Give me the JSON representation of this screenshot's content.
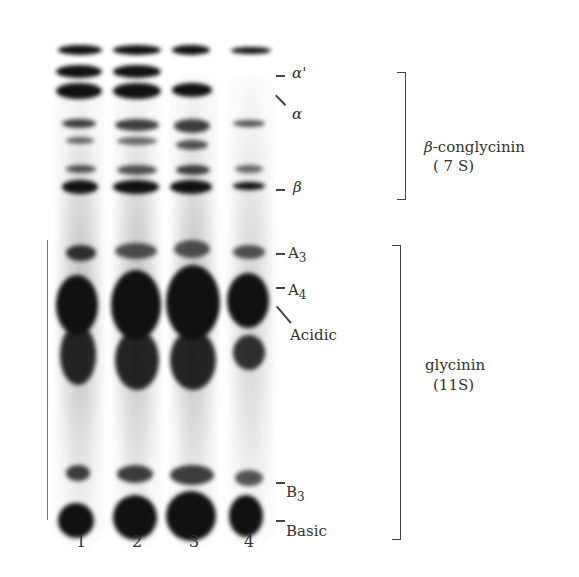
{
  "figure": {
    "type": "SDS-PAGE gel electrophoresis",
    "lanes": [
      {
        "number": "1"
      },
      {
        "number": "2"
      },
      {
        "number": "3"
      },
      {
        "number": "4"
      }
    ],
    "band_labels": {
      "alpha_prime": "α'",
      "alpha": "α",
      "beta": "β",
      "A3_base": "A",
      "A3_sub": "3",
      "A4_base": "A",
      "A4_sub": "4",
      "acidic": "Acidic",
      "B3_base": "B",
      "B3_sub": "3",
      "basic": "Basic"
    },
    "groups": {
      "conglycinin": {
        "line1_symbol": "β",
        "line1_text": "-conglycinin",
        "line2": "( 7 S)"
      },
      "glycinin": {
        "line1": "glycinin",
        "line2": "(11S)"
      }
    }
  }
}
